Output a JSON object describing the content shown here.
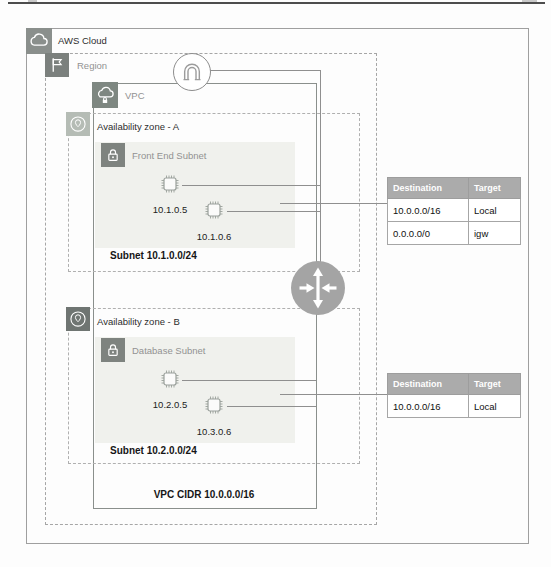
{
  "diagram": {
    "aws_cloud": {
      "label": "AWS Cloud"
    },
    "region": {
      "label": "Region"
    },
    "vpc": {
      "label": "VPC",
      "cidr_label": "VPC CIDR 10.0.0.0/16"
    },
    "availability_zones": [
      {
        "label": "Availability zone - A",
        "subnet": {
          "label": "Front End Subnet",
          "cidr_label": "Subnet 10.1.0.0/24",
          "instances": [
            {
              "ip": "10.1.0.5"
            },
            {
              "ip": "10.1.0.6"
            }
          ]
        }
      },
      {
        "label": "Availability zone - B",
        "subnet": {
          "label": "Database Subnet",
          "cidr_label": "Subnet 10.2.0.0/24",
          "instances": [
            {
              "ip": "10.2.0.5"
            },
            {
              "ip": "10.3.0.6"
            }
          ]
        }
      }
    ],
    "route_tables": [
      {
        "headers": [
          "Destination",
          "Target"
        ],
        "rows": [
          [
            "10.0.0.0/16",
            "Local"
          ],
          [
            "0.0.0.0/0",
            "igw"
          ]
        ]
      },
      {
        "headers": [
          "Destination",
          "Target"
        ],
        "rows": [
          [
            "10.0.0.0/16",
            "Local"
          ]
        ]
      }
    ],
    "icons": [
      "aws-cloud-icon",
      "region-flag-icon",
      "vpc-cloud-lock-icon",
      "availability-zone-pin-icon",
      "private-subnet-lock-icon",
      "ec2-instance-chip-icon",
      "internet-gateway-icon",
      "vpc-router-icon"
    ],
    "colors": {
      "table_header_bg": "#ababab",
      "subnet_fill": "#f0f1ed",
      "icon_dark_gray": "#7e837f",
      "icon_light_gray": "#b5bcb5",
      "router_gray": "#a4a4a4",
      "line_gray": "#8f8f8f",
      "text_dark": "#1f1f1f",
      "text_gray": "#929292"
    }
  }
}
